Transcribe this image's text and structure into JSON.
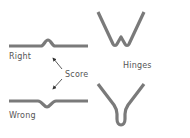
{
  "diagram": {
    "labels": {
      "right": "Right",
      "wrong": "Wrong",
      "score": "Score",
      "hinges": "Hinges"
    },
    "colors": {
      "stroke": "#7a7a7a",
      "arrow": "#333333",
      "text": "#555555",
      "background": "#ffffff"
    },
    "elements": [
      {
        "id": "right-fold",
        "description": "horizontal strip with upward score bump",
        "label": "Right"
      },
      {
        "id": "wrong-fold",
        "description": "horizontal strip with downward score notch",
        "label": "Wrong"
      },
      {
        "id": "score-arrows",
        "description": "two arrows pointing from Score label to both scores",
        "label": "Score"
      },
      {
        "id": "hinge-w",
        "description": "W-shaped hinge profile",
        "label": "Hinges"
      },
      {
        "id": "hinge-v",
        "description": "V-shaped hinge profile with rounded base",
        "label": "Hinges"
      }
    ]
  }
}
